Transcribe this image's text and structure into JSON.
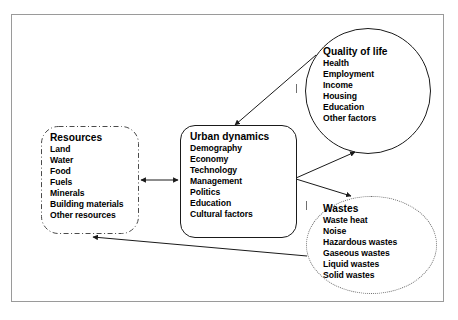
{
  "diagram": {
    "background_color": "#ffffff",
    "frame_color": "#9a9a9a",
    "line_color": "#1a1a1a",
    "nodes": [
      {
        "id": "resources",
        "title": "Resources",
        "shape": "rounded-rectangle",
        "border_style": "dash-dot",
        "items": [
          "Land",
          "Water",
          "Food",
          "Fuels",
          "Minerals",
          "Building materials",
          "Other resources"
        ]
      },
      {
        "id": "urban-dynamics",
        "title": "Urban dynamics",
        "shape": "rounded-rectangle",
        "border_style": "solid",
        "items": [
          "Demography",
          "Economy",
          "Technology",
          "Management",
          "Politics",
          "Education",
          "Cultural factors"
        ]
      },
      {
        "id": "quality-of-life",
        "title": "Quality of life",
        "shape": "circle",
        "border_style": "solid",
        "items": [
          "Health",
          "Employment",
          "Income",
          "Housing",
          "Education",
          "Other factors"
        ]
      },
      {
        "id": "wastes",
        "title": "Wastes",
        "shape": "ellipse",
        "border_style": "dotted",
        "items": [
          "Waste heat",
          "Noise",
          "Hazardous wastes",
          "Gaseous wastes",
          "Liquid wastes",
          "Solid wastes"
        ]
      }
    ],
    "edges": [
      {
        "id": "resources-urban",
        "from": "resources",
        "to": "urban-dynamics",
        "direction": "bidirectional"
      },
      {
        "id": "quality-urban",
        "from": "quality-of-life",
        "to": "urban-dynamics",
        "direction": "unidirectional"
      },
      {
        "id": "urban-quality",
        "from": "urban-dynamics",
        "to": "quality-of-life",
        "direction": "unidirectional"
      },
      {
        "id": "urban-wastes",
        "from": "urban-dynamics",
        "to": "wastes",
        "direction": "unidirectional"
      },
      {
        "id": "wastes-resources",
        "from": "wastes",
        "to": "resources",
        "direction": "unidirectional"
      }
    ]
  }
}
